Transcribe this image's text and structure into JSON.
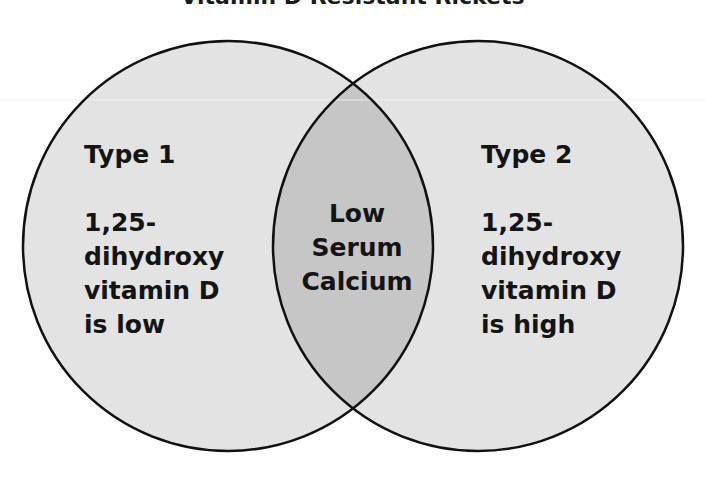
{
  "title": "Vitamin D Resistant Rickets",
  "colors": {
    "circle_fill": "#e3e3e3",
    "intersection_fill": "#c6c6c6",
    "stroke": "#111111",
    "text": "#141414"
  },
  "left_set": {
    "name": "Type 1",
    "lines": [
      "1,25-",
      "dihydroxy",
      "vitamin D",
      "is low"
    ]
  },
  "right_set": {
    "name": "Type 2",
    "lines": [
      "1,25-",
      "dihydroxy",
      "vitamin D",
      "is high"
    ]
  },
  "intersection": {
    "lines": [
      "Low",
      "Serum",
      "Calcium"
    ]
  }
}
